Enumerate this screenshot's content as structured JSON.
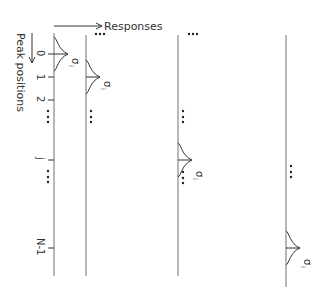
{
  "diagram": {
    "x_axis_label": "Responses",
    "y_axis_label": "Peak positions",
    "tick_labels": [
      "0",
      "1",
      "2",
      "j",
      "N-1"
    ],
    "sigma_label": "σ",
    "sigma_subscript": "i",
    "ellipsis": "•••",
    "line_color": "#888888",
    "stroke_color": "#333333"
  }
}
